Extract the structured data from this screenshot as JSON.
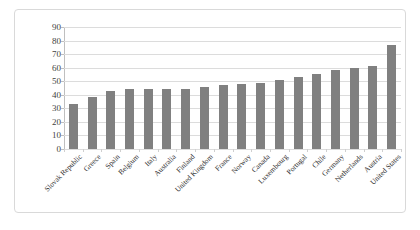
{
  "chart_data": {
    "type": "bar",
    "title": "",
    "subtitle": "",
    "xlabel": "",
    "ylabel": "",
    "ylim": [
      0,
      90
    ],
    "ytick_step": 10,
    "yticks": [
      90,
      80,
      70,
      60,
      50,
      40,
      30,
      20,
      10,
      0
    ],
    "grid": true,
    "legend": false,
    "legend_position": "none",
    "bar_color": "#808080",
    "gridline_color": "#dcdcdc",
    "axis_color": "#bfbfbf",
    "categories": [
      "Slovak Republic",
      "Greece",
      "Spain",
      "Belgium",
      "Italy",
      "Australia",
      "Finland",
      "United Kingdom",
      "France",
      "Norway",
      "Canada",
      "Luxembourg",
      "Portugal",
      "Chile",
      "Germany",
      "Netherlands",
      "Austria",
      "United States"
    ],
    "values": [
      33,
      38.5,
      43,
      44,
      44.5,
      44.5,
      44.5,
      46,
      47,
      48,
      49,
      51,
      53,
      55.5,
      58.5,
      60,
      61.5,
      77
    ]
  }
}
